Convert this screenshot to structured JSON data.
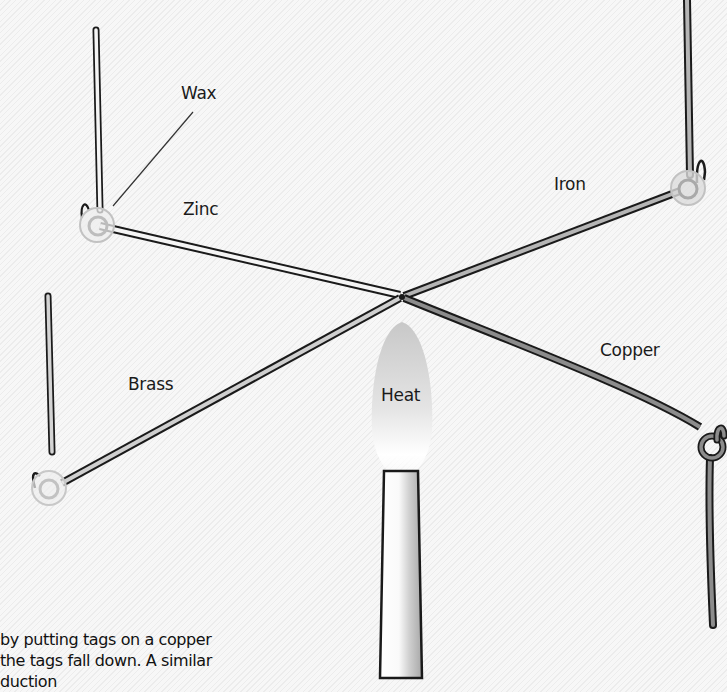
{
  "labels": {
    "wax": "Wax",
    "zinc": "Zinc",
    "iron": "Iron",
    "brass": "Brass",
    "copper": "Copper",
    "heat": "Heat"
  },
  "caption": {
    "line1": "by putting tags on a copper",
    "line2": " the tags fall down. A similar",
    "line3": "  duction"
  },
  "colors": {
    "background": "#f4f4f4",
    "outline": "#1a1a1a",
    "zinc_fill": "#f5f5f5",
    "brass_fill": "#cfcfcf",
    "iron_fill": "#b5b5b5",
    "copper_fill": "#8c8c8c",
    "wax": "#d8d8d8"
  }
}
